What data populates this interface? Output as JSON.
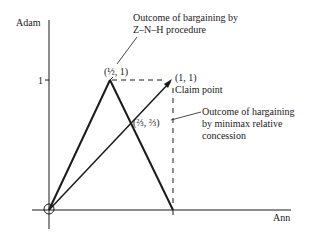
{
  "diagram": {
    "axes": {
      "y_label": "Adam",
      "x_label": "Ann",
      "y_tick": "1",
      "x_tick": "1"
    },
    "points": {
      "znh_outcome": "(½, 1)",
      "claim_coords": "(1, 1)",
      "claim_label": "Claim point",
      "minimax_outcome": "(⅔, ⅔)"
    },
    "annotations": {
      "znh_line1": "Outcome of bargaining by",
      "znh_line2": "Z–N–H procedure",
      "minimax_line1": "Outcome of hargaining",
      "minimax_line2": "by minimax relative",
      "minimax_line3": "concession"
    },
    "colors": {
      "ink": "#1a1a1a",
      "background": "#ffffff"
    }
  }
}
